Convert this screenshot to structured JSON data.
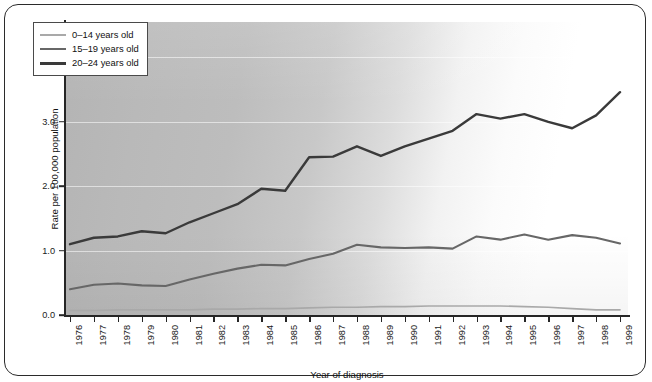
{
  "chart_data": {
    "type": "line",
    "title": "",
    "xlabel": "Year of diagnosis",
    "ylabel": "Rate per 100,000 population",
    "x": [
      1976,
      1977,
      1978,
      1979,
      1980,
      1981,
      1982,
      1983,
      1984,
      1985,
      1986,
      1987,
      1988,
      1989,
      1990,
      1991,
      1992,
      1993,
      1994,
      1995,
      1996,
      1997,
      1998,
      1999
    ],
    "xtick_labels": [
      "1976",
      "1977",
      "1978",
      "1979",
      "1980",
      "1981",
      "1982",
      "1983",
      "1984",
      "1985",
      "1986",
      "1987",
      "1988",
      "1989",
      "1990",
      "1991",
      "1992",
      "1993",
      "1994",
      "1995",
      "1996",
      "1997",
      "1998",
      "1999"
    ],
    "ytick_labels": [
      "0.0",
      "1.0",
      "2.0",
      "3.0",
      "4.0"
    ],
    "yticks": [
      0.0,
      1.0,
      2.0,
      3.0,
      4.0
    ],
    "ylim": [
      0.0,
      4.55
    ],
    "xlim": [
      1976,
      1999
    ],
    "grid": true,
    "legend_position": "top-left",
    "series": [
      {
        "name": "0–14 years old",
        "color": "#a9a9a9",
        "values": [
          0.07,
          0.07,
          0.08,
          0.08,
          0.08,
          0.08,
          0.09,
          0.09,
          0.1,
          0.1,
          0.11,
          0.12,
          0.12,
          0.13,
          0.13,
          0.14,
          0.14,
          0.14,
          0.14,
          0.13,
          0.12,
          0.1,
          0.08,
          0.08
        ]
      },
      {
        "name": "15–19 years old",
        "color": "#676767",
        "values": [
          0.4,
          0.47,
          0.49,
          0.46,
          0.45,
          0.55,
          0.64,
          0.72,
          0.78,
          0.77,
          0.87,
          0.95,
          1.09,
          1.05,
          1.04,
          1.05,
          1.03,
          1.22,
          1.17,
          1.25,
          1.17,
          1.24,
          1.2,
          1.11
        ]
      },
      {
        "name": "20–24 years old",
        "color": "#3a3a3a",
        "values": [
          1.1,
          1.2,
          1.22,
          1.3,
          1.27,
          1.44,
          1.58,
          1.72,
          1.96,
          1.93,
          2.45,
          2.46,
          2.62,
          2.47,
          2.62,
          2.74,
          2.86,
          3.12,
          3.05,
          3.12,
          3.0,
          2.9,
          3.1,
          3.46
        ]
      }
    ]
  },
  "legend": {
    "items": [
      {
        "label": "0–14 years old"
      },
      {
        "label": "15–19 years old"
      },
      {
        "label": "20–24 years old"
      }
    ]
  }
}
